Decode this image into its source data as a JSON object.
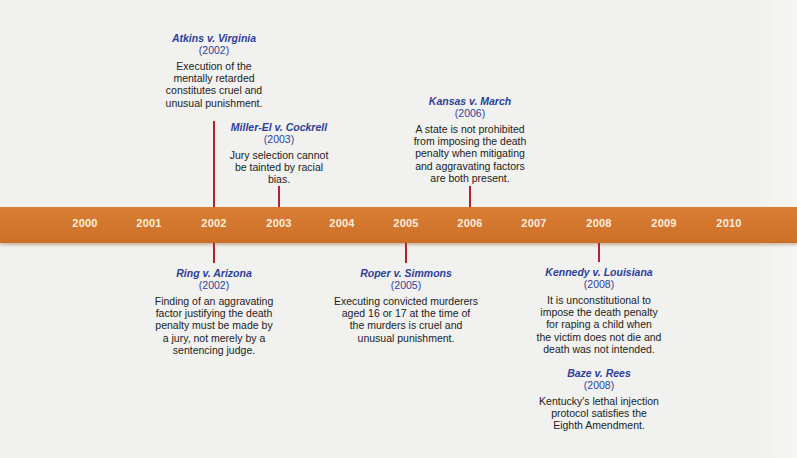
{
  "timeline": {
    "band_color": "#d8762a",
    "connector_color": "#b5202e",
    "title_color": "#2e3f98",
    "years": [
      "2000",
      "2001",
      "2002",
      "2003",
      "2004",
      "2005",
      "2006",
      "2007",
      "2008",
      "2009",
      "2010"
    ]
  },
  "events": {
    "atkins": {
      "title": "Atkins v. Virginia",
      "year": "(2002)",
      "desc_lines": [
        "Execution of the",
        "mentally retarded",
        "constitutes cruel and",
        "unusual punishment."
      ],
      "position": "above",
      "anchor_year": "2002"
    },
    "miller_el": {
      "title": "Miller-El v. Cockrell",
      "year": "(2003)",
      "desc_lines": [
        "Jury selection cannot",
        "be tainted by racial",
        "bias."
      ],
      "position": "above",
      "anchor_year": "2003"
    },
    "kansas": {
      "title": "Kansas v. March",
      "year": "(2006)",
      "desc_lines": [
        "A state is not prohibited",
        "from imposing the death",
        "penalty when mitigating",
        "and aggravating factors",
        "are both present."
      ],
      "position": "above",
      "anchor_year": "2006"
    },
    "ring": {
      "title": "Ring v. Arizona",
      "year": "(2002)",
      "desc_lines": [
        "Finding of an aggravating",
        "factor justifying the death",
        "penalty must be made by",
        "a jury, not merely by a",
        "sentencing judge."
      ],
      "position": "below",
      "anchor_year": "2002"
    },
    "roper": {
      "title": "Roper v. Simmons",
      "year": "(2005)",
      "desc_lines": [
        "Executing convicted murderers",
        "aged 16 or 17 at the time of",
        "the murders is cruel and",
        "unusual punishment."
      ],
      "position": "below",
      "anchor_year": "2005"
    },
    "kennedy": {
      "title": "Kennedy v. Louisiana",
      "year": "(2008)",
      "desc_lines": [
        "It is unconstitutional to",
        "impose the death penalty",
        "for raping a child when",
        "the victim does not die and",
        "death was not intended."
      ],
      "position": "below",
      "anchor_year": "2008"
    },
    "baze": {
      "title": "Baze v. Rees",
      "year": "(2008)",
      "desc_lines": [
        "Kentucky's lethal injection",
        "protocol satisfies the",
        "Eighth Amendment."
      ],
      "position": "below",
      "anchor_year": "2008"
    }
  }
}
